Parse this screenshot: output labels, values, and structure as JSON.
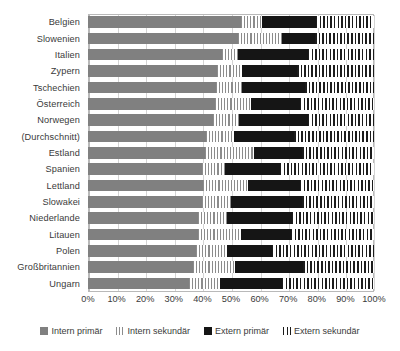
{
  "chart_data": {
    "type": "bar",
    "orientation": "horizontal",
    "stacked": true,
    "stack_mode": "percent",
    "title": "",
    "subtitle": "",
    "xlabel": "",
    "ylabel": "",
    "xlim": [
      0,
      100
    ],
    "grid": true,
    "legend_position": "bottom",
    "xtick_labels": [
      "0%",
      "10%",
      "20%",
      "30%",
      "40%",
      "50%",
      "60%",
      "70%",
      "80%",
      "90%",
      "100%"
    ],
    "xtick_values": [
      0,
      10,
      20,
      30,
      40,
      50,
      60,
      70,
      80,
      90,
      100
    ],
    "categories": [
      "Belgien",
      "Slowenien",
      "Italien",
      "Zypern",
      "Tschechien",
      "Österreich",
      "Norwegen",
      "(Durchschnitt)",
      "Estland",
      "Spanien",
      "Lettland",
      "Slowakei",
      "Niederlande",
      "Litauen",
      "Polen",
      "Großbritannien",
      "Ungarn"
    ],
    "series": [
      {
        "name": "Intern primär",
        "color": "#808080",
        "pattern": "solid",
        "values": [
          53.5,
          52.5,
          47.0,
          45.0,
          44.8,
          44.4,
          43.7,
          41.3,
          41.0,
          40.0,
          40.2,
          40.0,
          38.5,
          38.5,
          37.8,
          36.8,
          35.4
        ]
      },
      {
        "name": "Intern sekundär",
        "color": "#8c8c8c",
        "pattern": "vertical-stripes-light",
        "values": [
          7.5,
          15.5,
          5.5,
          9.0,
          9.2,
          12.6,
          9.1,
          9.7,
          17.0,
          8.0,
          15.8,
          10.0,
          10.1,
          15.0,
          10.8,
          14.6,
          10.6
        ]
      },
      {
        "name": "Extern primär",
        "color": "#151515",
        "pattern": "solid",
        "values": [
          18.7,
          11.4,
          24.5,
          19.0,
          22.0,
          17.0,
          24.2,
          21.0,
          16.8,
          19.0,
          18.0,
          25.0,
          22.8,
          17.5,
          15.7,
          23.8,
          22.0
        ]
      },
      {
        "name": "Extern sekundär",
        "color": "#1c1c1c",
        "pattern": "vertical-stripes-dark",
        "values": [
          20.3,
          20.6,
          23.0,
          27.0,
          24.0,
          26.0,
          23.0,
          28.0,
          25.2,
          33.0,
          26.0,
          25.0,
          28.6,
          29.0,
          35.7,
          24.8,
          32.0
        ]
      }
    ]
  },
  "legend": {
    "items": [
      {
        "label": "Intern primär",
        "key": "intern-primaer"
      },
      {
        "label": "Intern sekundär",
        "key": "intern-sekundaer"
      },
      {
        "label": "Extern primär",
        "key": "extern-primaer"
      },
      {
        "label": "Extern sekundär",
        "key": "extern-sekundaer"
      }
    ]
  }
}
